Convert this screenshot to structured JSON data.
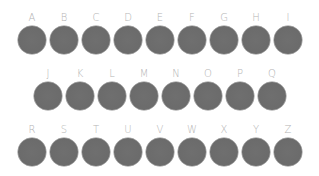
{
  "keyboard": {
    "circle_color": "#6b6b6b",
    "label_color": "#b4b4b4",
    "rows": [
      {
        "keys": [
          "A",
          "B",
          "C",
          "D",
          "E",
          "F",
          "G",
          "H",
          "I"
        ]
      },
      {
        "keys": [
          "J",
          "K",
          "L",
          "M",
          "N",
          "O",
          "P",
          "Q"
        ]
      },
      {
        "keys": [
          "R",
          "S",
          "T",
          "U",
          "V",
          "W",
          "X",
          "Y",
          "Z"
        ]
      }
    ]
  }
}
